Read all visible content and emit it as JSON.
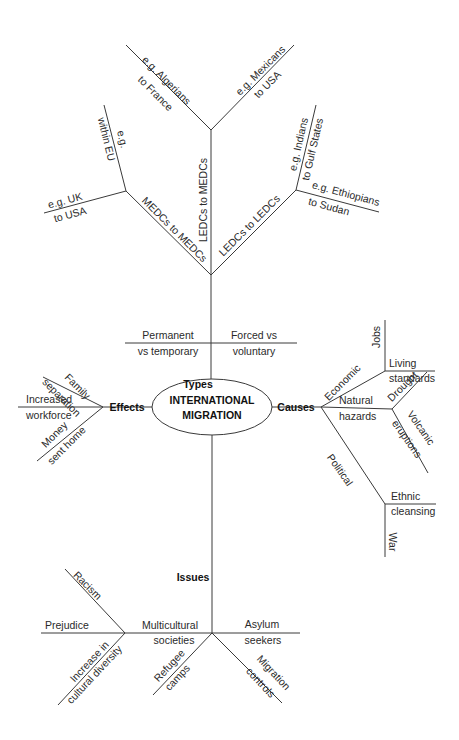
{
  "center": {
    "line1": "INTERNATIONAL",
    "line2": "MIGRATION"
  },
  "types": {
    "label": "Types",
    "branches": [
      {
        "line1": "Permanent",
        "line2": "vs temporary"
      },
      {
        "line1": "Forced vs",
        "line2": "voluntary"
      }
    ],
    "flows": {
      "ledc_medc": {
        "label": "LEDCs to MEDCs",
        "ex1": {
          "line1": "e.g. Algerians",
          "line2": "to France"
        },
        "ex2": {
          "line1": "e.g. Mexicans",
          "line2": "to USA"
        }
      },
      "medc_medc": {
        "label": "MEDCs to MEDCs",
        "ex1": {
          "line1": "e.g.",
          "line2": "within EU"
        },
        "ex2": {
          "line1": "e.g. UK",
          "line2": "to USA"
        }
      },
      "ledc_ledc": {
        "label": "LEDCs to LEDCs",
        "ex1": {
          "line1": "e.g. Indians",
          "line2": "to Gulf States"
        },
        "ex2": {
          "line1": "e.g. Ethiopians",
          "line2": "to Sudan"
        }
      }
    }
  },
  "effects": {
    "label": "Effects",
    "items": [
      {
        "line1": "Family",
        "line2": "separation"
      },
      {
        "line1": "Increased",
        "line2": "workforce"
      },
      {
        "line1": "Money",
        "line2": "sent home"
      }
    ]
  },
  "causes": {
    "label": "Causes",
    "economic": {
      "label": "Economic",
      "items": [
        {
          "line1": "Jobs"
        },
        {
          "line1": "Living",
          "line2": "standards"
        }
      ]
    },
    "natural": {
      "line1": "Natural",
      "line2": "hazards",
      "items": [
        {
          "line1": "Drought"
        },
        {
          "line1": "Volcanic",
          "line2": "eruptions"
        }
      ]
    },
    "political": {
      "label": "Political",
      "items": [
        {
          "line1": "Ethnic",
          "line2": "cleansing"
        },
        {
          "line1": "War"
        }
      ]
    }
  },
  "issues": {
    "label": "Issues",
    "multicultural": {
      "line1": "Multicultural",
      "line2": "societies",
      "items": [
        {
          "line1": "Racism"
        },
        {
          "line1": "Prejudice"
        },
        {
          "line1": "Increase in",
          "line2": "cultural diversity"
        }
      ]
    },
    "asylum": {
      "line1": "Asylum",
      "line2": "seekers"
    },
    "refugee": {
      "line1": "Refugee",
      "line2": "camps"
    },
    "controls": {
      "line1": "Migration",
      "line2": "controls"
    }
  }
}
